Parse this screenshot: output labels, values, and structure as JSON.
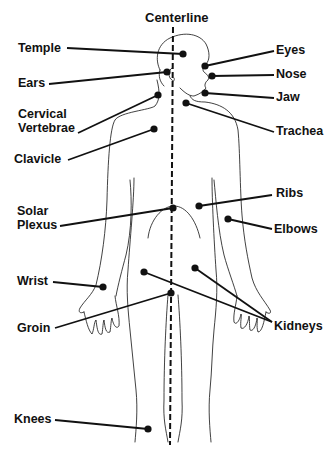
{
  "diagram": {
    "title": "Centerline",
    "ink_color": "#111111",
    "background": "#ffffff",
    "points": [
      {
        "id": "temple",
        "label": "Temple",
        "side": "left",
        "label_x": 18,
        "label_y": 41,
        "line_start": [
          67,
          48
        ],
        "dot": [
          183,
          54
        ]
      },
      {
        "id": "ears",
        "label": "Ears",
        "side": "left",
        "label_x": 18,
        "label_y": 76,
        "line_start": [
          49,
          84
        ],
        "dot": [
          167,
          72
        ]
      },
      {
        "id": "cervical-vertebrae",
        "label": "Cervical\nVertebrae",
        "label_lines": [
          "Cervical",
          "Vertebrae"
        ],
        "side": "left",
        "label_x": 18,
        "label_y": 107,
        "line_start": [
          78,
          133
        ],
        "dot": [
          158,
          95
        ]
      },
      {
        "id": "clavicle",
        "label": "Clavicle",
        "side": "left",
        "label_x": 14,
        "label_y": 152,
        "line_start": [
          68,
          160
        ],
        "dot": [
          154,
          129
        ]
      },
      {
        "id": "solar-plexus",
        "label": "Solar\nPlexus",
        "label_lines": [
          "Solar",
          "Plexus"
        ],
        "side": "left",
        "label_x": 17,
        "label_y": 204,
        "line_start": [
          60,
          226
        ],
        "dot": [
          173,
          208
        ]
      },
      {
        "id": "wrist",
        "label": "Wrist",
        "side": "left",
        "label_x": 17,
        "label_y": 274,
        "line_start": [
          53,
          282
        ],
        "dot": [
          103,
          287
        ]
      },
      {
        "id": "groin",
        "label": "Groin",
        "side": "left",
        "label_x": 17,
        "label_y": 321,
        "line_start": [
          55,
          328
        ],
        "dot": [
          171,
          293
        ]
      },
      {
        "id": "knees",
        "label": "Knees",
        "side": "left",
        "label_x": 14,
        "label_y": 412,
        "line_start": [
          55,
          420
        ],
        "dot": [
          148,
          429
        ]
      },
      {
        "id": "eyes",
        "label": "Eyes",
        "side": "right",
        "label_x": 276,
        "label_y": 43,
        "line_start": [
          274,
          51
        ],
        "dot": [
          205,
          66
        ]
      },
      {
        "id": "nose",
        "label": "Nose",
        "side": "right",
        "label_x": 276,
        "label_y": 67,
        "line_start": [
          274,
          75
        ],
        "dot": [
          212,
          76
        ]
      },
      {
        "id": "jaw",
        "label": "Jaw",
        "side": "right",
        "label_x": 276,
        "label_y": 90,
        "line_start": [
          274,
          98
        ],
        "dot": [
          205,
          93
        ]
      },
      {
        "id": "trachea",
        "label": "Trachea",
        "side": "right",
        "label_x": 276,
        "label_y": 124,
        "line_start": [
          274,
          132
        ],
        "dot": [
          186,
          103
        ]
      },
      {
        "id": "ribs",
        "label": "Ribs",
        "side": "right",
        "label_x": 276,
        "label_y": 186,
        "line_start": [
          272,
          195
        ],
        "dot": [
          199,
          206
        ]
      },
      {
        "id": "elbows",
        "label": "Elbows",
        "side": "right",
        "label_x": 274,
        "label_y": 222,
        "line_start": [
          272,
          229
        ],
        "dot": [
          228,
          219
        ]
      },
      {
        "id": "kidneys-left",
        "label": "Kidneys",
        "side": "right",
        "label_x": 274,
        "label_y": 319,
        "line_start": [
          272,
          322
        ],
        "dot": [
          144,
          272
        ]
      },
      {
        "id": "kidneys-right",
        "label": "",
        "side": "right",
        "label_x": 274,
        "label_y": 319,
        "line_start": [
          272,
          322
        ],
        "dot": [
          195,
          268
        ]
      }
    ]
  }
}
